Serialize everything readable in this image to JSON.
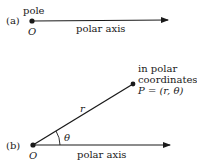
{
  "panel_a": {
    "tag": "(a)",
    "pole_label": "pole",
    "origin_label": "O",
    "axis_label": "polar axis"
  },
  "panel_b": {
    "tag": "(b)",
    "origin_label": "O",
    "axis_label": "polar axis",
    "radius_label": "r",
    "angle_label": "θ",
    "point_caption_line1": "in polar",
    "point_caption_line2": "coordinates,",
    "point_label": "P = (r, θ)"
  },
  "colors": {
    "ink": "#1a1a1a",
    "background": "#ffffff"
  }
}
